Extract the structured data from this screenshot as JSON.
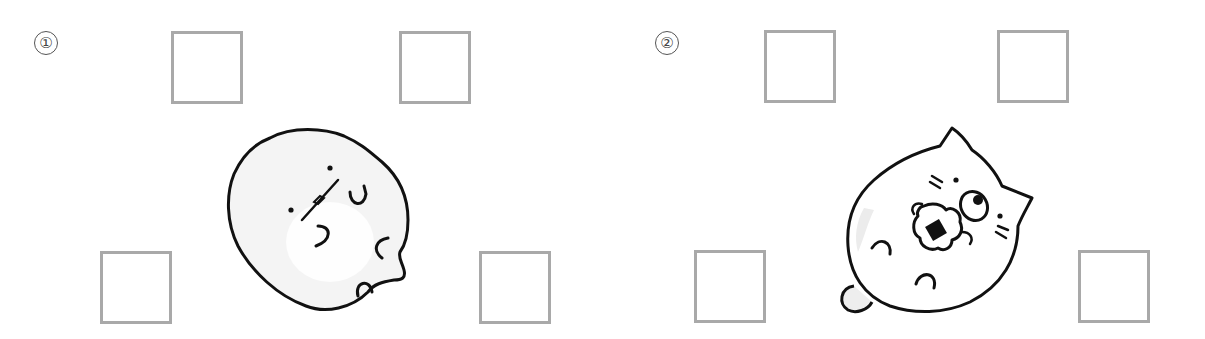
{
  "problems": [
    {
      "label": "①",
      "character": "tapioca-blob-character",
      "answers": [
        "",
        "",
        "",
        ""
      ]
    },
    {
      "label": "②",
      "character": "cat-character-eating-onigiri",
      "answers": [
        "",
        "",
        "",
        ""
      ]
    }
  ],
  "colors": {
    "box_border": "#a9a9a9",
    "outline": "#111111",
    "body_fill": "#f4f4f4",
    "label": "#555555"
  }
}
